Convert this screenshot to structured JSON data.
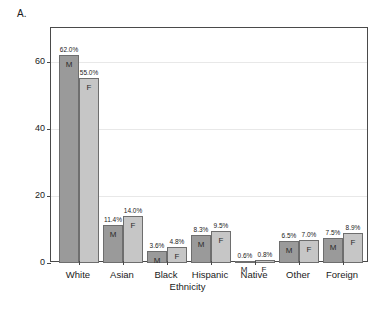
{
  "panel": {
    "label": "A."
  },
  "chart_data": {
    "type": "bar",
    "title": "",
    "xlabel": "Ethnicity",
    "ylabel": "Percent",
    "ylim": [
      0,
      70
    ],
    "yticks": [
      0,
      20,
      40,
      60
    ],
    "ytick_labels": [
      "0",
      "20",
      "40",
      "60"
    ],
    "grid": true,
    "gridlines_at": [
      20,
      40,
      60
    ],
    "legend": "none",
    "categories": [
      "White",
      "Asian",
      "Black",
      "Hispanic",
      "Native",
      "Other",
      "Foreign"
    ],
    "series": [
      {
        "name": "M",
        "short_label": "M",
        "color": "#9a9a9a",
        "values": [
          62.0,
          11.4,
          3.6,
          8.3,
          0.6,
          6.5,
          7.5
        ],
        "data_labels": [
          "62.0%",
          "11.4%",
          "3.6%",
          "8.3%",
          "0.6%",
          "6.5%",
          "7.5%"
        ]
      },
      {
        "name": "F",
        "short_label": "F",
        "color": "#c6c6c6",
        "values": [
          55.0,
          14.0,
          4.8,
          9.5,
          0.8,
          7.0,
          8.9
        ],
        "data_labels": [
          "55.0%",
          "14.0%",
          "4.8%",
          "9.5%",
          "0.8%",
          "7.0%",
          "8.9%"
        ]
      }
    ],
    "bar_inner_labels_inside": [
      [
        true,
        true
      ],
      [
        true,
        true
      ],
      [
        true,
        true
      ],
      [
        true,
        true
      ],
      [
        false,
        false
      ],
      [
        true,
        true
      ],
      [
        true,
        true
      ]
    ]
  }
}
